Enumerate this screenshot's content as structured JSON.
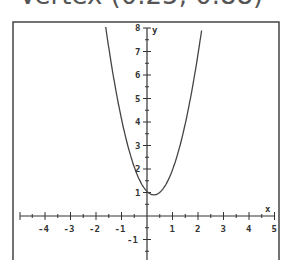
{
  "header": {
    "title": "Vertex (0.25, 0.88)"
  },
  "chart_data": {
    "type": "line",
    "title": "Vertex (0.25, 0.88)",
    "xlabel": "x",
    "ylabel": "y",
    "xlim": [
      -5,
      5
    ],
    "ylim": [
      -1.5,
      8
    ],
    "x_ticks": [
      "-4",
      "-3",
      "-2",
      "-1",
      "1",
      "2",
      "3",
      "4",
      "5"
    ],
    "y_ticks": [
      "-1",
      "1",
      "2",
      "3",
      "4",
      "5",
      "6",
      "7",
      "8"
    ],
    "grid": false,
    "series": [
      {
        "name": "parabola",
        "x": [
          -1.6,
          -1.25,
          -1.0,
          -0.75,
          -0.5,
          -0.25,
          0.0,
          0.25,
          0.5,
          0.75,
          1.0,
          1.25,
          1.5,
          1.75,
          2.1
        ],
        "values": [
          7.9,
          5.5,
          4.1,
          3.0,
          2.1,
          1.4,
          1.0,
          0.88,
          1.0,
          1.4,
          2.0,
          2.8,
          3.9,
          5.2,
          7.9
        ]
      }
    ]
  }
}
